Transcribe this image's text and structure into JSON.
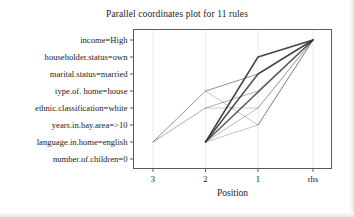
{
  "chart_data": {
    "type": "line",
    "title": "Parallel coordinates plot for 11 rules",
    "xlabel": "Position",
    "ylabel": "",
    "x_tick_labels": [
      "3",
      "2",
      "1",
      "rhs"
    ],
    "y_tick_labels": [
      "income=High",
      "householder.status=own",
      "marital.status=married",
      "type.of. home=house",
      "ethnic.classification=white",
      "years.in.bay.area=>10",
      "language.in.home=english",
      "number.of.children=0"
    ],
    "grid": true,
    "legend": "none",
    "n_rules": 11,
    "axis_positions": [
      "3",
      "2",
      "1",
      "rhs"
    ],
    "series": [
      {
        "name": "rule-1",
        "opacity": 0.95,
        "points": [
          {
            "x": "2",
            "y": "language.in.home=english"
          },
          {
            "x": "1",
            "y": "householder.status=own"
          },
          {
            "x": "rhs",
            "y": "income=High"
          }
        ]
      },
      {
        "name": "rule-2",
        "opacity": 0.9,
        "points": [
          {
            "x": "2",
            "y": "language.in.home=english"
          },
          {
            "x": "1",
            "y": "marital.status=married"
          },
          {
            "x": "rhs",
            "y": "income=High"
          }
        ]
      },
      {
        "name": "rule-3",
        "opacity": 0.8,
        "points": [
          {
            "x": "2",
            "y": "language.in.home=english"
          },
          {
            "x": "rhs",
            "y": "income=High"
          }
        ]
      },
      {
        "name": "rule-4",
        "opacity": 0.55,
        "points": [
          {
            "x": "3",
            "y": "language.in.home=english"
          },
          {
            "x": "2",
            "y": "type.of. home=house"
          },
          {
            "x": "1",
            "y": "marital.status=married"
          },
          {
            "x": "rhs",
            "y": "income=High"
          }
        ]
      },
      {
        "name": "rule-5",
        "opacity": 0.4,
        "points": [
          {
            "x": "3",
            "y": "language.in.home=english"
          },
          {
            "x": "2",
            "y": "ethnic.classification=white"
          },
          {
            "x": "1",
            "y": "type.of. home=house"
          },
          {
            "x": "rhs",
            "y": "income=High"
          }
        ]
      },
      {
        "name": "rule-6",
        "opacity": 0.35,
        "points": [
          {
            "x": "2",
            "y": "language.in.home=english"
          },
          {
            "x": "1",
            "y": "ethnic.classification=white"
          },
          {
            "x": "rhs",
            "y": "income=High"
          }
        ]
      },
      {
        "name": "rule-7",
        "opacity": 0.3,
        "points": [
          {
            "x": "2",
            "y": "language.in.home=english"
          },
          {
            "x": "1",
            "y": "years.in.bay.area=>10"
          },
          {
            "x": "rhs",
            "y": "income=High"
          }
        ]
      },
      {
        "name": "rule-8",
        "opacity": 0.3,
        "points": [
          {
            "x": "2",
            "y": "type.of. home=house"
          },
          {
            "x": "1",
            "y": "years.in.bay.area=>10"
          },
          {
            "x": "rhs",
            "y": "income=High"
          }
        ]
      },
      {
        "name": "rule-9",
        "opacity": 0.25,
        "points": [
          {
            "x": "2",
            "y": "ethnic.classification=white"
          },
          {
            "x": "1",
            "y": "ethnic.classification=white"
          },
          {
            "x": "rhs",
            "y": "income=High"
          }
        ]
      },
      {
        "name": "rule-10",
        "opacity": 0.22,
        "points": [
          {
            "x": "2",
            "y": "language.in.home=english"
          },
          {
            "x": "1",
            "y": "type.of. home=house"
          },
          {
            "x": "rhs",
            "y": "income=High"
          }
        ]
      },
      {
        "name": "rule-11",
        "opacity": 0.2,
        "points": [
          {
            "x": "1",
            "y": "years.in.bay.area=>10"
          },
          {
            "x": "rhs",
            "y": "income=High"
          }
        ]
      }
    ],
    "colors": {
      "line": "#3a3a3a",
      "frame": "#5a5a5a",
      "grid": "#ebebeb",
      "text": "#1b1b1b",
      "background": "#ffffff"
    }
  }
}
